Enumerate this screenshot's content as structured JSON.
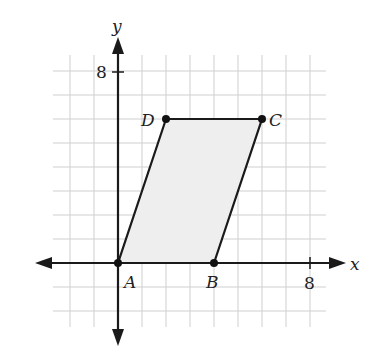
{
  "diagram": {
    "type": "coordinate-plane",
    "axes": {
      "x_label": "x",
      "y_label": "y",
      "x_tick_label": "8",
      "y_tick_label": "8",
      "x_range": [
        -2,
        8
      ],
      "y_range": [
        -2,
        8
      ],
      "grid_step": 1
    },
    "shape": {
      "name": "parallelogram ABCD",
      "fill": "#eeeeee",
      "stroke": "#1a1a1a",
      "vertices": [
        {
          "label": "A",
          "x": 0,
          "y": 0
        },
        {
          "label": "B",
          "x": 4,
          "y": 0
        },
        {
          "label": "C",
          "x": 6,
          "y": 6
        },
        {
          "label": "D",
          "x": 2,
          "y": 6
        }
      ]
    },
    "colors": {
      "grid": "#cfcfcf",
      "axis": "#1a1a1a",
      "shape_fill": "#eeeeee"
    }
  }
}
